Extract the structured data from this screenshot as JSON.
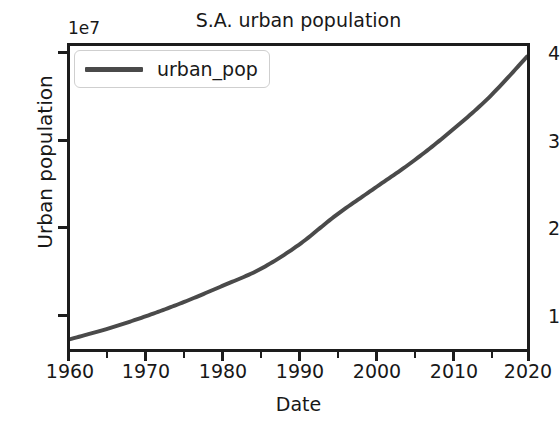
{
  "chart_data": {
    "type": "line",
    "title": "S.A. urban population",
    "xlabel": "Date",
    "ylabel": "Urban population",
    "offset_text": "1e7",
    "grid": false,
    "legend_position": "upper left",
    "xlim": [
      1960,
      2020
    ],
    "ylim": [
      7100000,
      41200000
    ],
    "xticks": [
      1960,
      1970,
      1980,
      1990,
      2000,
      2010,
      2020
    ],
    "xtick_labels": [
      "1960",
      "1970",
      "1980",
      "1990",
      "2000",
      "2010",
      "2020"
    ],
    "xminor_ticks": [
      1965,
      1975,
      1985,
      1995,
      2005,
      2015
    ],
    "yticks": [
      10000000,
      20000000,
      30000000,
      40000000
    ],
    "ytick_labels": [
      "1",
      "2",
      "3",
      "4"
    ],
    "y_scale_factor": 10000000,
    "line_color": "#4a4a4a",
    "line_width": 4,
    "series": [
      {
        "name": "urban_pop",
        "x": [
          1960,
          1965,
          1970,
          1975,
          1980,
          1985,
          1990,
          1995,
          2000,
          2005,
          2010,
          2015,
          2020
        ],
        "values": [
          8200000,
          9400000,
          10800000,
          12400000,
          14200000,
          16100000,
          18800000,
          22200000,
          25200000,
          28200000,
          31600000,
          35400000,
          40000000
        ]
      }
    ]
  },
  "legend": {
    "entries": [
      {
        "label": "urban_pop",
        "color": "#4a4a4a"
      }
    ]
  }
}
